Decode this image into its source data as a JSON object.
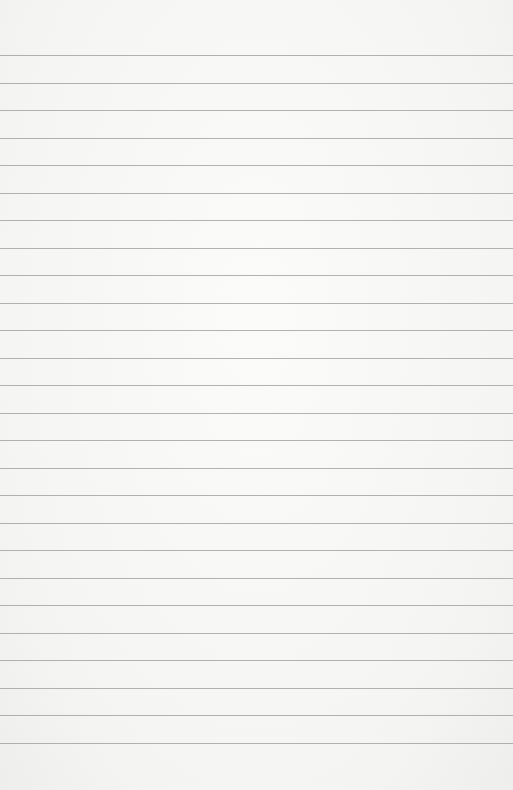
{
  "paper": {
    "type": "lined-paper",
    "line_count": 26,
    "first_line_y": 55,
    "line_spacing": 27.5,
    "line_color": "#9a9a98",
    "background_color": "#f6f6f4"
  }
}
